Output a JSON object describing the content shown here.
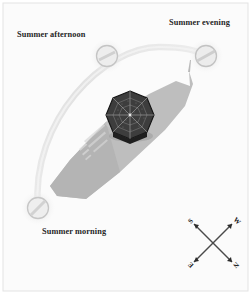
{
  "figure": {
    "kind": "sun-path-shadow-study",
    "background_color": "#fbfbfb",
    "border_color": "#e2e2e2"
  },
  "labels": {
    "afternoon": "Summer afternoon",
    "evening": "Summer evening",
    "morning": "Summer morning"
  },
  "sun_positions": [
    {
      "name": "summer-morning",
      "label": "Summer morning",
      "x": 38,
      "y": 208,
      "radius": 11
    },
    {
      "name": "summer-afternoon",
      "label": "Summer afternoon",
      "x": 107,
      "y": 56,
      "radius": 11
    },
    {
      "name": "summer-evening",
      "label": "Summer evening",
      "x": 206,
      "y": 56,
      "radius": 11
    }
  ],
  "sun_arc": {
    "name": "sun-path-arc",
    "color": "#e7e7e7",
    "stroke_width": 6
  },
  "building": {
    "name": "geodesic-dome",
    "dome_color": "#3a3a3a",
    "dome_outline": "#1a1a1a",
    "center_x": 130,
    "center_y": 114,
    "radius": 23
  },
  "shadow": {
    "name": "building-shadow",
    "color": "#b6b6b6",
    "detail_color": "#cfcfcf"
  },
  "compass": {
    "name": "compass-rose",
    "center_x": 213,
    "center_y": 243,
    "arm_length": 27,
    "rotation_degrees": 45,
    "color": "#3f3f3f",
    "points": [
      {
        "name": "compass-letter-s",
        "letter": "S",
        "position": "top-left"
      },
      {
        "name": "compass-letter-w",
        "letter": "W",
        "position": "top-right"
      },
      {
        "name": "compass-letter-e",
        "letter": "E",
        "position": "bottom-left"
      },
      {
        "name": "compass-letter-n",
        "letter": "N",
        "position": "bottom-right"
      }
    ]
  }
}
